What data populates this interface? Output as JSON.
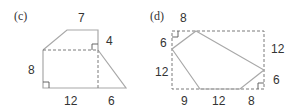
{
  "figures": [
    {
      "id": "c",
      "tag": "(c)",
      "labels": {
        "top": "7",
        "right_top": "4",
        "left": "8",
        "bottom_left": "12",
        "bottom_right": "6"
      }
    },
    {
      "id": "d",
      "tag": "(d)",
      "labels": {
        "top": "8",
        "left_top": "6",
        "left_bottom": "12",
        "right_top": "12",
        "right_bottom": "6",
        "bottom_left": "9",
        "bottom_mid": "12",
        "bottom_right": "8"
      }
    }
  ],
  "colors": {
    "solid_line": "#a8a8a8",
    "dashed_line": "#7a7a7a",
    "text": "#333333"
  }
}
